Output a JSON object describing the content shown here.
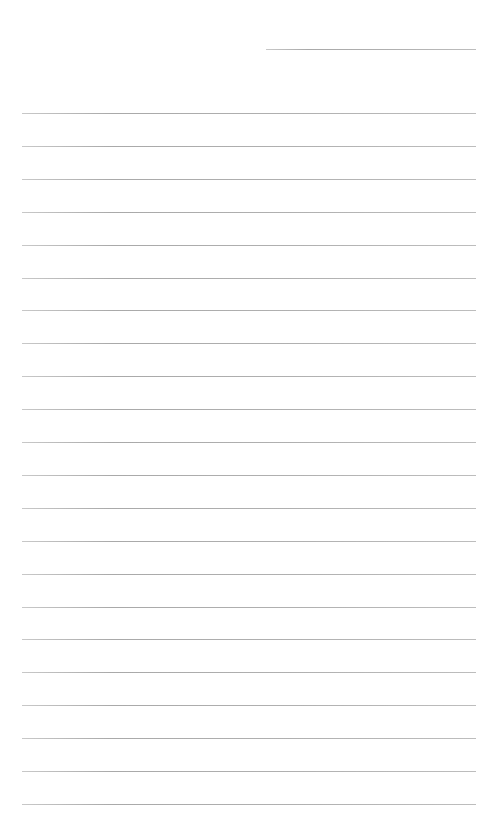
{
  "page": {
    "type": "lined-paper",
    "background_color": "#ffffff",
    "line_color": "#b0b0b0",
    "header_line": {
      "x": 266,
      "y": 49,
      "width": 210
    },
    "body_lines": {
      "count": 22,
      "x": 22,
      "width": 454,
      "first_y": 113,
      "spacing": 32.9
    },
    "text": ""
  }
}
